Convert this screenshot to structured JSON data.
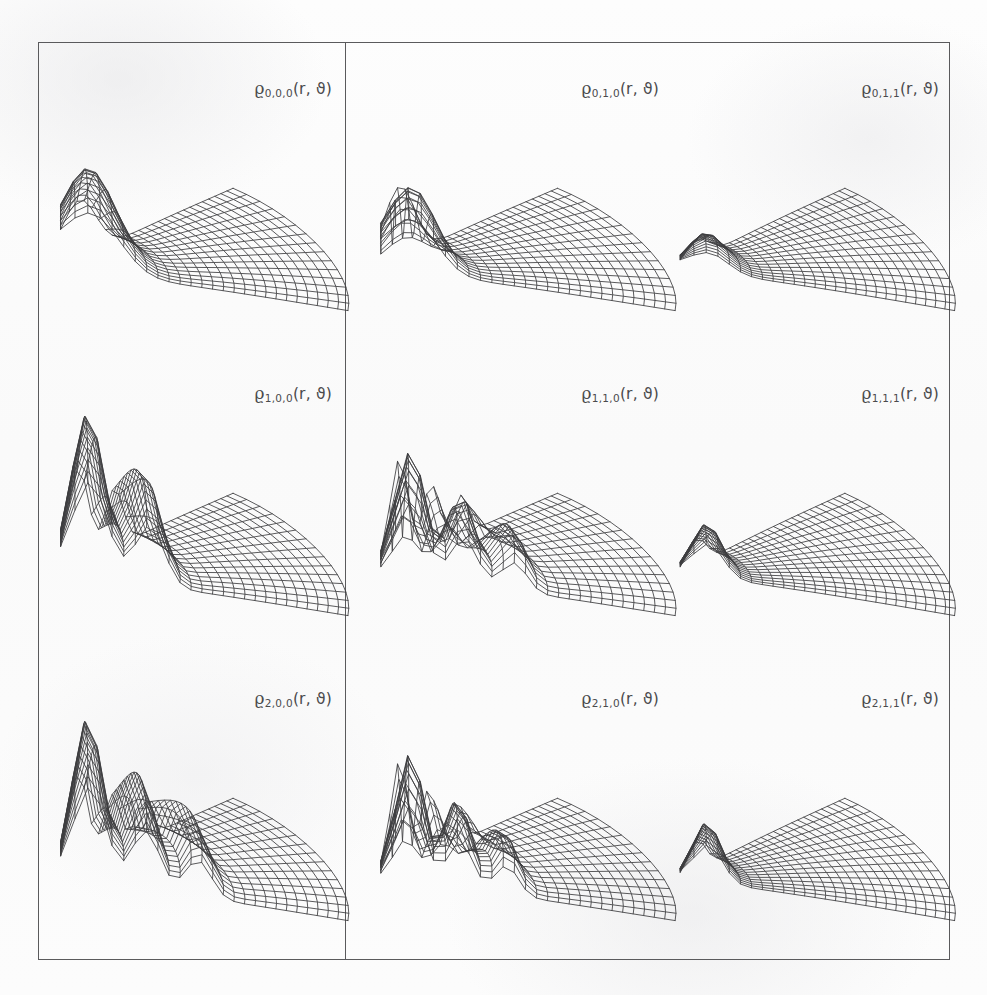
{
  "figure": {
    "background_color": "#fbfbfb",
    "frame_color": "#5a5a5c",
    "line_color": "#3c3c3e",
    "columns": 3,
    "rows": 3
  },
  "chart_data": {
    "type": "surface",
    "title": "",
    "xlabel": "r",
    "ylabel": "ϑ",
    "zlabel": "ϱ",
    "grid": true,
    "legend_position": "none",
    "projection": "polar-wireframe-3d",
    "panels": [
      {
        "id": "p000",
        "row": 0,
        "col": 0,
        "label_rho": "ϱ",
        "label_sub": "0,0,0",
        "label_args": "(r, ϑ)",
        "n": 0,
        "l": 0,
        "m": 0,
        "radial_nodes": 0,
        "angular_nodes": 0,
        "peak_height": 0.62,
        "peak_width": 0.13,
        "peak_angle_frac": 0.5,
        "angular_lobes": 0
      },
      {
        "id": "p010",
        "row": 0,
        "col": 1,
        "label_rho": "ϱ",
        "label_sub": "0,1,0",
        "label_args": "(r, ϑ)",
        "n": 0,
        "l": 1,
        "m": 0,
        "radial_nodes": 0,
        "angular_nodes": 1,
        "peak_height": 0.52,
        "peak_width": 0.11,
        "peak_angle_frac": 0.28,
        "angular_lobes": 1
      },
      {
        "id": "p011",
        "row": 0,
        "col": 2,
        "label_rho": "ϱ",
        "label_sub": "0,1,1",
        "label_args": "(r, ϑ)",
        "n": 0,
        "l": 1,
        "m": 1,
        "radial_nodes": 0,
        "angular_nodes": 0,
        "peak_height": 0.2,
        "peak_width": 0.09,
        "peak_angle_frac": 0.5,
        "angular_lobes": 0
      },
      {
        "id": "p100",
        "row": 1,
        "col": 0,
        "label_rho": "ϱ",
        "label_sub": "1,0,0",
        "label_args": "(r, ϑ)",
        "n": 1,
        "l": 0,
        "m": 0,
        "radial_nodes": 1,
        "angular_nodes": 0,
        "peak_height": 1.0,
        "peak_width": 0.075,
        "peak_angle_frac": 0.5,
        "angular_lobes": 0
      },
      {
        "id": "p110",
        "row": 1,
        "col": 1,
        "label_rho": "ϱ",
        "label_sub": "1,1,0",
        "label_args": "(r, ϑ)",
        "n": 1,
        "l": 1,
        "m": 0,
        "radial_nodes": 2,
        "angular_nodes": 1,
        "peak_height": 0.78,
        "peak_width": 0.065,
        "peak_angle_frac": 0.3,
        "angular_lobes": 1
      },
      {
        "id": "p111",
        "row": 1,
        "col": 2,
        "label_rho": "ϱ",
        "label_sub": "1,1,1",
        "label_args": "(r, ϑ)",
        "n": 1,
        "l": 1,
        "m": 1,
        "radial_nodes": 0,
        "angular_nodes": 0,
        "peak_height": 0.3,
        "peak_width": 0.07,
        "peak_angle_frac": 0.42,
        "angular_lobes": 0
      },
      {
        "id": "p200",
        "row": 2,
        "col": 0,
        "label_rho": "ϱ",
        "label_sub": "2,0,0",
        "label_args": "(r, ϑ)",
        "n": 2,
        "l": 0,
        "m": 0,
        "radial_nodes": 2,
        "angular_nodes": 0,
        "peak_height": 1.0,
        "peak_width": 0.07,
        "peak_angle_frac": 0.5,
        "angular_lobes": 0
      },
      {
        "id": "p210",
        "row": 2,
        "col": 1,
        "label_rho": "ϱ",
        "label_sub": "2,1,0",
        "label_args": "(r, ϑ)",
        "n": 2,
        "l": 1,
        "m": 0,
        "radial_nodes": 2,
        "angular_nodes": 1,
        "peak_height": 0.8,
        "peak_width": 0.06,
        "peak_angle_frac": 0.3,
        "angular_lobes": 1
      },
      {
        "id": "p211",
        "row": 2,
        "col": 2,
        "label_rho": "ϱ",
        "label_sub": "2,1,1",
        "label_args": "(r, ϑ)",
        "n": 2,
        "l": 1,
        "m": 1,
        "radial_nodes": 0,
        "angular_nodes": 0,
        "peak_height": 0.34,
        "peak_width": 0.065,
        "peak_angle_frac": 0.42,
        "angular_lobes": 0
      }
    ]
  }
}
